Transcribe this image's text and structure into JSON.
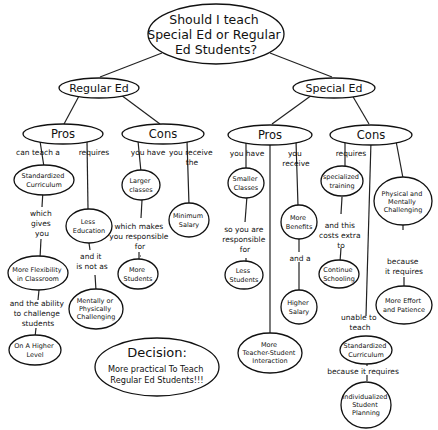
{
  "title": [
    "Should I teach",
    "Special Ed or Regular",
    "Ed Students?"
  ],
  "branches": {
    "regular": {
      "label": "Regular Ed",
      "pros": {
        "label": "Pros",
        "link_a": [
          "can teach a"
        ],
        "node_a": [
          "Standardized",
          "Curriculum"
        ],
        "link_a2": [
          "which",
          "gives",
          "you"
        ],
        "node_a2": [
          "More Flexibility",
          "in Classroom"
        ],
        "link_a3": [
          "and the ability",
          "to challenge",
          "students"
        ],
        "node_a3": [
          "On A Higher",
          "Level"
        ],
        "link_b": [
          "requires"
        ],
        "node_b": [
          "Less",
          "Education"
        ],
        "link_b2": [
          "and it",
          "is not as"
        ],
        "node_b2": [
          "Mentally or",
          "Physically",
          "Challenging"
        ]
      },
      "cons": {
        "label": "Cons",
        "link_a": [
          "you have"
        ],
        "node_a": [
          "Larger",
          "classes"
        ],
        "link_a2": [
          "which makes",
          "you responsible",
          "for"
        ],
        "node_a2": [
          "More",
          "Students"
        ],
        "link_b": [
          "you receive",
          "the"
        ],
        "node_b": [
          "Minimum",
          "Salary"
        ]
      }
    },
    "special": {
      "label": "Special Ed",
      "pros": {
        "label": "Pros",
        "link_a": [
          "you have"
        ],
        "node_a": [
          "Smaller",
          "Classes"
        ],
        "link_a2": [
          "so you are",
          "responsible",
          "for"
        ],
        "node_a2": [
          "Less",
          "Students"
        ],
        "node_c": [
          "More",
          "Teacher-Student",
          "Interaction"
        ],
        "link_b": [
          "you",
          "receive"
        ],
        "node_b": [
          "More",
          "Benefits"
        ],
        "link_b2": [
          "and a"
        ],
        "node_b2": [
          "Higher",
          "Salary"
        ]
      },
      "cons": {
        "label": "Cons",
        "link_a": [
          "requires"
        ],
        "node_a": [
          "specialized",
          "training"
        ],
        "link_a2": [
          "and this",
          "costs extra",
          "to"
        ],
        "node_a2": [
          "Continue",
          "Schooling"
        ],
        "link_c": [
          "unable to",
          "teach"
        ],
        "node_c": [
          "Standardized",
          "Curriculum"
        ],
        "link_c2": [
          "because it requires"
        ],
        "node_c2": [
          "Individualized",
          "Student",
          "Planning"
        ],
        "node_b": [
          "Physical and",
          "Mentally",
          "Challenging"
        ],
        "link_b2": [
          "because",
          "it requires"
        ],
        "node_b2": [
          "More Effort",
          "and Patience"
        ]
      }
    }
  },
  "decision": {
    "heading": "Decision:",
    "lines": [
      "More practical To Teach",
      "Regular Ed Students!!!"
    ]
  }
}
